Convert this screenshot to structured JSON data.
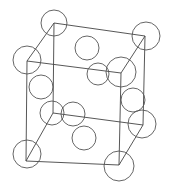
{
  "diagram": {
    "type": "crystal-unit-cell",
    "colors": {
      "edge": "#444444",
      "atom_outline": "#555555",
      "background": "#ffffff"
    },
    "vertices": {
      "top_back_left": [
        54,
        23
      ],
      "top_back_right": [
        145,
        36
      ],
      "top_front_left": [
        27,
        61
      ],
      "top_front_right": [
        121,
        73
      ],
      "bottom_back_left": [
        53,
        113
      ],
      "bottom_back_right": [
        143,
        125
      ],
      "bottom_front_left": [
        26,
        161
      ],
      "bottom_front_right": [
        119,
        165
      ]
    },
    "edges": [
      [
        "top_back_left",
        "top_back_right"
      ],
      [
        "top_back_left",
        "top_front_left"
      ],
      [
        "top_back_right",
        "top_front_right"
      ],
      [
        "top_front_left",
        "top_front_right"
      ],
      [
        "bottom_back_left",
        "bottom_back_right"
      ],
      [
        "bottom_back_left",
        "bottom_front_left"
      ],
      [
        "bottom_back_right",
        "bottom_front_right"
      ],
      [
        "bottom_front_left",
        "bottom_front_right"
      ],
      [
        "top_back_left",
        "bottom_back_left"
      ],
      [
        "top_back_right",
        "bottom_back_right"
      ],
      [
        "top_front_left",
        "bottom_front_left"
      ],
      [
        "top_front_right",
        "bottom_front_right"
      ]
    ],
    "atoms": [
      {
        "name": "corner-top-back-left",
        "cx": 54,
        "cy": 23,
        "r": 13
      },
      {
        "name": "corner-top-back-right",
        "cx": 146,
        "cy": 36,
        "r": 14
      },
      {
        "name": "corner-top-front-left",
        "cx": 27,
        "cy": 60,
        "r": 14
      },
      {
        "name": "corner-top-front-right",
        "cx": 121,
        "cy": 72,
        "r": 15
      },
      {
        "name": "face-top",
        "cx": 87,
        "cy": 48,
        "r": 12
      },
      {
        "name": "face-front-upper",
        "cx": 98,
        "cy": 74,
        "r": 11
      },
      {
        "name": "face-left-upper",
        "cx": 41,
        "cy": 87,
        "r": 12
      },
      {
        "name": "face-right-upper",
        "cx": 133,
        "cy": 100,
        "r": 12
      },
      {
        "name": "corner-bottom-back-left",
        "cx": 52,
        "cy": 113,
        "r": 12
      },
      {
        "name": "face-back-lower",
        "cx": 73,
        "cy": 114,
        "r": 12
      },
      {
        "name": "corner-bottom-back-right",
        "cx": 142,
        "cy": 124,
        "r": 14
      },
      {
        "name": "face-bottom",
        "cx": 84,
        "cy": 138,
        "r": 12
      },
      {
        "name": "corner-bottom-front-left",
        "cx": 27,
        "cy": 154,
        "r": 14
      },
      {
        "name": "corner-bottom-front-right",
        "cx": 119,
        "cy": 166,
        "r": 15
      }
    ]
  }
}
